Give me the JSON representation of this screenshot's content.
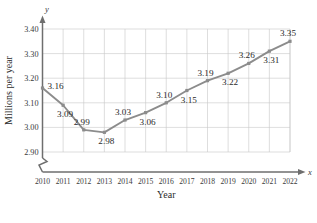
{
  "chart_data": {
    "type": "line",
    "title": "",
    "xlabel": "Year",
    "ylabel": "Millions per year",
    "x_axis_name": "x",
    "y_axis_name": "y",
    "categories": [
      2010,
      2011,
      2012,
      2013,
      2014,
      2015,
      2016,
      2017,
      2018,
      2019,
      2020,
      2021,
      2022
    ],
    "tick_labels_x": [
      "2010",
      "2011",
      "2012",
      "2013",
      "2014",
      "2015",
      "2016",
      "2017",
      "2018",
      "2019",
      "2020",
      "2021",
      "2022"
    ],
    "values": [
      3.16,
      3.09,
      2.99,
      2.98,
      3.03,
      3.06,
      3.1,
      3.15,
      3.19,
      3.22,
      3.26,
      3.31,
      3.35
    ],
    "point_labels": [
      "3.16",
      "3.09",
      "2.99",
      "2.98",
      "3.03",
      "3.06",
      "3.10",
      "3.15",
      "3.19",
      "3.22",
      "3.26",
      "3.31",
      "3.35"
    ],
    "label_positions": [
      "right",
      "below",
      "above",
      "below",
      "above",
      "below",
      "above",
      "below",
      "above",
      "below",
      "above",
      "below",
      "above"
    ],
    "ylim": [
      2.9,
      3.4
    ],
    "yticks": [
      2.9,
      3.0,
      3.1,
      3.2,
      3.3,
      3.4
    ],
    "tick_labels_y": [
      "2.90",
      "3.00",
      "3.10",
      "3.20",
      "3.30",
      "3.40"
    ],
    "grid": true,
    "legend": "none",
    "axis_break": true,
    "series_color": "#8c8c8c",
    "grid_color": "#c8c8c8",
    "axis_color": "#6e6e6e"
  }
}
